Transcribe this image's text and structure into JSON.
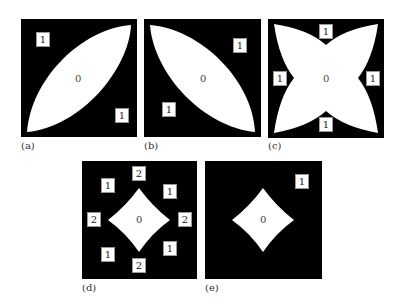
{
  "figure": {
    "panels": [
      {
        "id": "a",
        "caption": "(a)",
        "shape": "lens-diagonal-up",
        "center_label": "0",
        "region_labels": [
          "1",
          "1"
        ]
      },
      {
        "id": "b",
        "caption": "(b)",
        "shape": "lens-diagonal-down",
        "center_label": "0",
        "region_labels": [
          "1",
          "1"
        ]
      },
      {
        "id": "c",
        "caption": "(c)",
        "shape": "four-pointed-star",
        "center_label": "0",
        "region_labels": [
          "1",
          "1",
          "1",
          "1"
        ]
      },
      {
        "id": "d",
        "caption": "(d)",
        "shape": "diamond",
        "center_label": "0",
        "region_labels": [
          "2",
          "1",
          "1",
          "2",
          "2",
          "1",
          "1",
          "2"
        ]
      },
      {
        "id": "e",
        "caption": "(e)",
        "shape": "diamond",
        "center_label": "0",
        "region_labels": [
          "1"
        ]
      }
    ],
    "colors": {
      "background": "#000000",
      "shape": "#ffffff",
      "badge_border": "#999999"
    }
  }
}
